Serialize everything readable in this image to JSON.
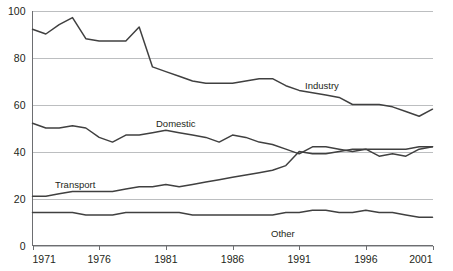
{
  "chart_data": {
    "type": "line",
    "title": "",
    "subtitle": "",
    "xlabel": "",
    "ylabel": "",
    "xlim": [
      1971,
      2001
    ],
    "ylim": [
      0,
      100
    ],
    "grid": true,
    "legend": "inline-labels",
    "x_ticks": [
      "1971",
      "1976",
      "1981",
      "1986",
      "1991",
      "1996",
      "2001"
    ],
    "y_ticks": [
      "0",
      "20",
      "40",
      "60",
      "80",
      "100"
    ],
    "x": [
      1971,
      1972,
      1973,
      1974,
      1975,
      1976,
      1977,
      1978,
      1979,
      1980,
      1981,
      1982,
      1983,
      1984,
      1985,
      1986,
      1987,
      1988,
      1989,
      1990,
      1991,
      1992,
      1993,
      1994,
      1995,
      1996,
      1997,
      1998,
      1999,
      2000,
      2001
    ],
    "series": [
      {
        "name": "Industry",
        "label": "Industry",
        "color": "#404040",
        "values": [
          92,
          90,
          94,
          97,
          88,
          87,
          87,
          87,
          93,
          76,
          74,
          72,
          70,
          69,
          69,
          69,
          70,
          71,
          71,
          68,
          66,
          65,
          64,
          63,
          60,
          60,
          60,
          59,
          57,
          55,
          58
        ]
      },
      {
        "name": "Domestic",
        "label": "Domestic",
        "color": "#6d6e71",
        "values": [
          52,
          50,
          50,
          51,
          50,
          46,
          44,
          47,
          47,
          48,
          49,
          48,
          47,
          46,
          44,
          47,
          46,
          44,
          43,
          41,
          39,
          42,
          42,
          41,
          40,
          41,
          38,
          39,
          38,
          41,
          42
        ]
      },
      {
        "name": "Transport",
        "label": "Transport",
        "color": "#404040",
        "values": [
          21,
          21,
          22,
          23,
          23,
          23,
          23,
          24,
          25,
          25,
          26,
          25,
          26,
          27,
          28,
          29,
          30,
          31,
          32,
          34,
          40,
          39,
          39,
          40,
          41,
          41,
          41,
          41,
          41,
          42,
          42
        ]
      },
      {
        "name": "Other",
        "label": "Other",
        "color": "#6d6e71",
        "values": [
          14,
          14,
          14,
          14,
          13,
          13,
          13,
          14,
          14,
          14,
          14,
          14,
          13,
          13,
          13,
          13,
          13,
          13,
          13,
          14,
          14,
          15,
          15,
          14,
          14,
          15,
          14,
          14,
          13,
          12,
          12
        ]
      }
    ],
    "annotations": [
      {
        "text": "Industry",
        "x": 305,
        "y": 89
      },
      {
        "text": "Domestic",
        "x": 156,
        "y": 127
      },
      {
        "text": "Transport",
        "x": 55,
        "y": 188
      },
      {
        "text": "Other",
        "x": 271,
        "y": 237
      }
    ]
  },
  "colors": {
    "background": "#ffffff",
    "gridline": "#bcbec0",
    "axis": "#6d6e71",
    "line_dark": "#404040",
    "line_grey": "#6d6e71",
    "text": "#231f20"
  }
}
